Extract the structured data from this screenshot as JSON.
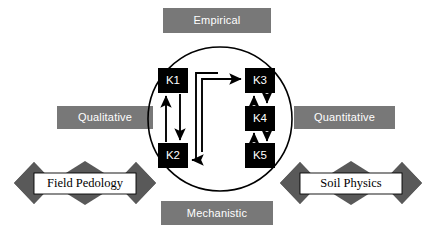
{
  "diagram": {
    "colors": {
      "plate_fill": "#787878",
      "plate_text": "#ffffff",
      "node_fill": "#000000",
      "node_text": "#ffffff",
      "ribbon_fill": "#595959",
      "ribbon_label_fill": "#ffffff",
      "stroke": "#000000",
      "background": "#ffffff"
    },
    "axis_labels": {
      "top": "Empirical",
      "bottom": "Mechanistic",
      "left": "Qualitative",
      "right": "Quantitative"
    },
    "ribbons": [
      {
        "id": "field-pedology",
        "label": "Field Pedology",
        "side": "left"
      },
      {
        "id": "soil-physics",
        "label": "Soil Physics",
        "side": "right"
      }
    ],
    "nodes": [
      {
        "id": "k1",
        "label": "K1",
        "column": "left",
        "row": "top"
      },
      {
        "id": "k2",
        "label": "K2",
        "column": "left",
        "row": "bottom"
      },
      {
        "id": "k3",
        "label": "K3",
        "column": "right",
        "row": "top"
      },
      {
        "id": "k4",
        "label": "K4",
        "column": "right",
        "row": "middle"
      },
      {
        "id": "k5",
        "label": "K5",
        "column": "right",
        "row": "bottom"
      }
    ],
    "edges": [
      {
        "from": "k1",
        "to": "k2",
        "style": "bidirectional-pair",
        "routing": "vertical"
      },
      {
        "from": "k3",
        "to": "k4",
        "style": "bidirectional-pair",
        "routing": "vertical"
      },
      {
        "from": "k4",
        "to": "k5",
        "style": "bidirectional-pair",
        "routing": "vertical"
      },
      {
        "from": "k2",
        "to": "k3",
        "style": "directed",
        "routing": "orthogonal-inner"
      },
      {
        "from": "k5",
        "to": "k2",
        "style": "directed",
        "routing": "orthogonal-outer"
      }
    ],
    "circle": {
      "cx": 220,
      "cy": 119,
      "r": 72,
      "label": "knowledge-domain-circle"
    }
  }
}
